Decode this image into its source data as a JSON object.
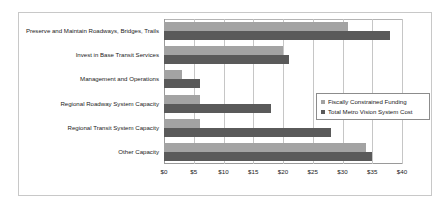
{
  "chart_data": {
    "type": "bar",
    "orientation": "horizontal",
    "title": "",
    "xlabel": "",
    "ylabel": "",
    "xlim": [
      0,
      40
    ],
    "xticks": [
      0,
      5,
      10,
      15,
      20,
      25,
      30,
      35,
      40
    ],
    "xtick_labels": [
      "$0",
      "$5",
      "$10",
      "$15",
      "$20",
      "$25",
      "$30",
      "$35",
      "$40"
    ],
    "grid": true,
    "legend_position": "middle-right",
    "categories": [
      "Preserve and Maintain Roadways, Bridges, Trails",
      "Invest in Base Transit Services",
      "Management and Operations",
      "Regional Roadway System Capacity",
      "Regional Transit System Capacity",
      "Other Capacity"
    ],
    "series": [
      {
        "name": "Fiscally Constrained Funding",
        "color": "#a3a3a3",
        "values": [
          31,
          20,
          3,
          6,
          6,
          34
        ]
      },
      {
        "name": "Total Metro Vision System Cost",
        "color": "#5a5a5a",
        "values": [
          38,
          21,
          6,
          18,
          28,
          35
        ]
      }
    ]
  },
  "legend": {
    "items": [
      {
        "label": "Fiscally Constrained Funding"
      },
      {
        "label": "Total Metro Vision System Cost"
      }
    ]
  }
}
